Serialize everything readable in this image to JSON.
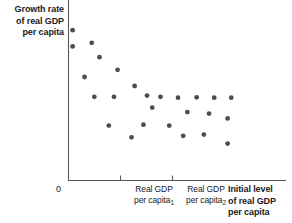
{
  "chart_data": {
    "type": "scatter",
    "title": "",
    "ylabel": "Growth rate of real GDP per capita",
    "xlabel": "Initial level of real GDP per capita",
    "grid": false,
    "legend": null,
    "axis": {
      "origin_label": "0",
      "x_tick_labels": [
        "Real GDP per capita₁",
        "Real GDP per capita₂"
      ],
      "x_tick_values": [
        1,
        2
      ],
      "xlim": [
        0,
        4.2
      ],
      "ylim": [
        0,
        10
      ]
    },
    "annotation": "Downward-sloping cloud of points: countries with a lower initial level of real GDP per capita tend to have higher growth rates of real GDP per capita (convergence).",
    "points": [
      {
        "x": 0.08,
        "y": 8.35
      },
      {
        "x": 0.45,
        "y": 7.65
      },
      {
        "x": 0.08,
        "y": 7.45
      },
      {
        "x": 0.6,
        "y": 6.85
      },
      {
        "x": 0.95,
        "y": 6.15
      },
      {
        "x": 0.31,
        "y": 5.75
      },
      {
        "x": 0.5,
        "y": 4.65
      },
      {
        "x": 0.88,
        "y": 4.65
      },
      {
        "x": 1.28,
        "y": 5.25
      },
      {
        "x": 1.52,
        "y": 4.72
      },
      {
        "x": 1.78,
        "y": 4.65
      },
      {
        "x": 2.12,
        "y": 4.6
      },
      {
        "x": 2.48,
        "y": 4.62
      },
      {
        "x": 2.82,
        "y": 4.6
      },
      {
        "x": 3.15,
        "y": 4.6
      },
      {
        "x": 1.62,
        "y": 4.05
      },
      {
        "x": 2.3,
        "y": 3.8
      },
      {
        "x": 2.72,
        "y": 3.72
      },
      {
        "x": 3.08,
        "y": 3.45
      },
      {
        "x": 0.78,
        "y": 3.05
      },
      {
        "x": 1.45,
        "y": 3.1
      },
      {
        "x": 1.95,
        "y": 3.05
      },
      {
        "x": 1.22,
        "y": 2.4
      },
      {
        "x": 2.22,
        "y": 2.48
      },
      {
        "x": 2.62,
        "y": 2.55
      },
      {
        "x": 3.08,
        "y": 2.05
      }
    ]
  },
  "labels": {
    "y_axis_title": "Growth rate of real GDP per capita",
    "y_axis_title_lines": [
      "Growth rate",
      "of real GDP",
      "per capita"
    ],
    "x_axis_title_lines": [
      "Initial level",
      "of real GDP",
      "per capita"
    ],
    "origin": "0",
    "x_tick_1_line1": "Real GDP",
    "x_tick_1_line2": "per capita",
    "x_tick_1_sub": "1",
    "x_tick_2_line1": "Real GDP",
    "x_tick_2_line2": "per capita",
    "x_tick_2_sub": "2"
  },
  "colors": {
    "point": "#4d4d4f",
    "axis": "#58585a",
    "text": "#1a1a1a",
    "background": "#ffffff"
  }
}
